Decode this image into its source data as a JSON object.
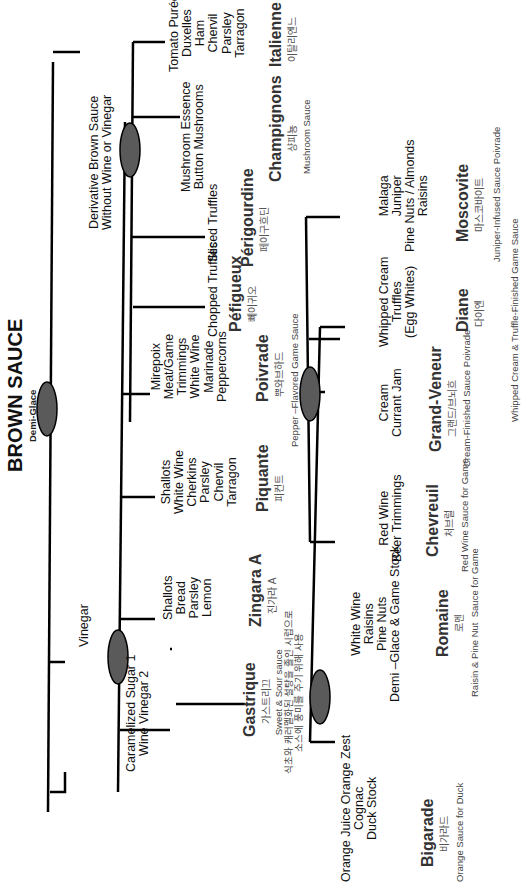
{
  "root": {
    "title": "BROWN SAUCE",
    "subtitle": "Demi-Glace"
  },
  "branches": {
    "vinegar": {
      "label": "Vinegar"
    },
    "derivative": {
      "label": "Derivative Brown Sauce\nWithout Wine or Vinegar"
    }
  },
  "sauces": {
    "gastrique": {
      "ingredients": "Caramelized Sugar 1\nWine Vinegar 2",
      "name": "Gastrique",
      "korean": "가스트리끄",
      "description": "Sweet & Sour sauce\n식초와 캐러멜화된 설탕을 졸인 시럽으로\n소스에 풍미를 주기 위해 사용"
    },
    "bigarade": {
      "ingredients": "Orange Juice Orange Zest\nCognac\nDuck Stock",
      "name": "Bigarade",
      "korean": "비가라드",
      "description": "Orange Sauce for Duck"
    },
    "romaine": {
      "ingredients": "White Wine\nRaisins\nPine Nuts\nDemi –Glace & Game Stock",
      "name": "Romaine",
      "korean": "로멘",
      "description": "Raisin & Pine Nut  Sauce for Game"
    },
    "zingara": {
      "ingredients": "Shallots\nBread\nParsley\nLemon",
      "name": "Zingara A",
      "korean": "진가라 A",
      "description": ""
    },
    "piquante": {
      "ingredients": "Shallots\nWhite Wine\nCherkins\nParsley\nChervil\nTarragon",
      "name": "Piquante",
      "korean": "피컨트",
      "description": ""
    },
    "poivrade": {
      "ingredients": "Mirepoix\nMeat/Game\nTrimmings\nWhite Wine\nMarinade\nPeppercorns",
      "name": "Poivrade",
      "korean": "뿌와브하드",
      "description": "Pepper –Flavored Game Sauce"
    },
    "chevreuil": {
      "ingredients": "Red Wine\nBeer Trimmings",
      "name": "Chevreuil",
      "korean": "처브럴",
      "description": "Red Wine Sauce for Game"
    },
    "grand_veneur": {
      "ingredients": "Cream\nCurrant Jam",
      "name": "Grand-Veneur",
      "korean": "그랜드/브뇌흐",
      "description": "Cream-Finished Sauce Poivrade"
    },
    "diane": {
      "ingredients": "Whipped Cream\nTruffles\n(Egg Whites)",
      "name": "Diane",
      "korean": "다이엔",
      "description": "Whipped Cream & Truffle-Finished Game Sauce"
    },
    "moscovite": {
      "ingredients": "Malaga\nJuniper\nPine Nuts / Almonds\nRaisins",
      "name": "Moscovite",
      "korean": "마스코바이트",
      "description": "Juniper-Infused Sauce Poivrade"
    },
    "perigueux": {
      "ingredients": "Chopped Truffles",
      "name": "Péfigueux",
      "korean": "뻬이귀오",
      "description": ""
    },
    "perigourdine": {
      "ingredients": "Sliced Truffles",
      "name": "Périgourdine",
      "korean": "페이구흐딘",
      "description": ""
    },
    "champignons": {
      "ingredients": "Mushroom Essence\nButton Mushrooms",
      "name": "Champignons",
      "korean": "샹피뇽",
      "description": "Mushroom Sauce"
    },
    "italienne": {
      "ingredients": "Tomato Purée\nDuxelles\nHam\nChervil\nParsley\nTarragon",
      "name": "Italienne",
      "korean": "이탈리엔느",
      "description": ""
    }
  },
  "colors": {
    "node_fill": "#5a5a5a",
    "line": "#000000",
    "text": "#111111"
  }
}
